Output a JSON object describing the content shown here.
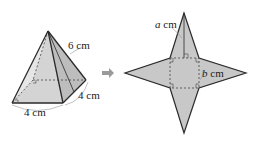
{
  "pyramid": {
    "slant_edge_label": "6 cm",
    "base_right_label": "4 cm",
    "base_front_label": "4 cm"
  },
  "arrow": {
    "icon": "right-arrow-icon"
  },
  "net": {
    "height_var": "a",
    "height_unit": " cm",
    "side_var": "b",
    "side_unit": " cm"
  },
  "colors": {
    "face_fill": "#c8c8c8",
    "face_light": "#e2e2e2",
    "edge": "#2a2a2a",
    "arrow": "#9a9a9a"
  }
}
